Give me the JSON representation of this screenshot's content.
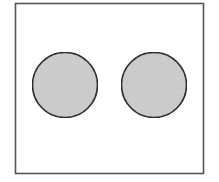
{
  "diagram": {
    "frame": {
      "x": 15.5,
      "y": 3.5,
      "width": 188,
      "height": 170,
      "stroke": "#555555",
      "fill": "#ffffff"
    },
    "circles": [
      {
        "label": "left-circle",
        "cx": 65,
        "cy": 85,
        "r": 32.5,
        "fill": "#d4d4d4",
        "stroke": "#333333"
      },
      {
        "label": "right-circle",
        "cx": 154,
        "cy": 85,
        "r": 32.5,
        "fill": "#d4d4d4",
        "stroke": "#333333"
      }
    ]
  }
}
